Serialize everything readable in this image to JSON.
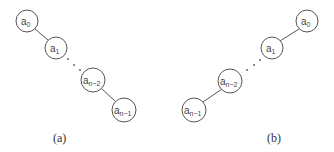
{
  "diagrams": [
    {
      "id": "a",
      "caption": "(a)",
      "nodes": [
        {
          "base": "a",
          "sub": "0"
        },
        {
          "base": "a",
          "sub": "1"
        },
        {
          "base": "a",
          "sub": "n−2"
        },
        {
          "base": "a",
          "sub": "n−1"
        }
      ],
      "ellipsis": "· · ·"
    },
    {
      "id": "b",
      "caption": "(b)",
      "nodes": [
        {
          "base": "a",
          "sub": "0"
        },
        {
          "base": "a",
          "sub": "1"
        },
        {
          "base": "a",
          "sub": "n−2"
        },
        {
          "base": "a",
          "sub": "n−1"
        }
      ],
      "ellipsis": "· · ·"
    }
  ]
}
